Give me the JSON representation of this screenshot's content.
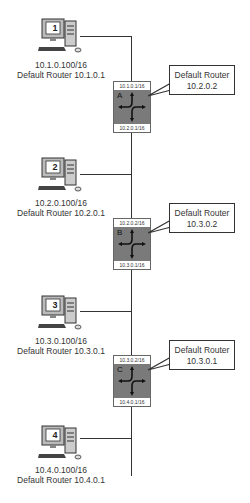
{
  "hosts": [
    {
      "number": "1",
      "ip": "10.1.0.100/16",
      "gateway": "Default Router 10.1.0.1"
    },
    {
      "number": "2",
      "ip": "10.2.0.100/16",
      "gateway": "Default Router 10.2.0.1"
    },
    {
      "number": "3",
      "ip": "10.3.0.100/16",
      "gateway": "Default Router 10.3.0.1"
    },
    {
      "number": "4",
      "ip": "10.4.0.100/16",
      "gateway": "Default Router 10.4.0.1"
    }
  ],
  "routers": [
    {
      "name": "A",
      "top_ip": "10.1.0.1/16",
      "bottom_ip": "10.2.0.1/16",
      "callout_line1": "Default Router",
      "callout_line2": "10.2.0.2"
    },
    {
      "name": "B",
      "top_ip": "10.2.0.2/16",
      "bottom_ip": "10.3.0.1/16",
      "callout_line1": "Default Router",
      "callout_line2": "10.3.0.2"
    },
    {
      "name": "C",
      "top_ip": "10.3.0.2/16",
      "bottom_ip": "10.4.0.1/16",
      "callout_line1": "Default Router",
      "callout_line2": "10.3.0.1"
    }
  ]
}
